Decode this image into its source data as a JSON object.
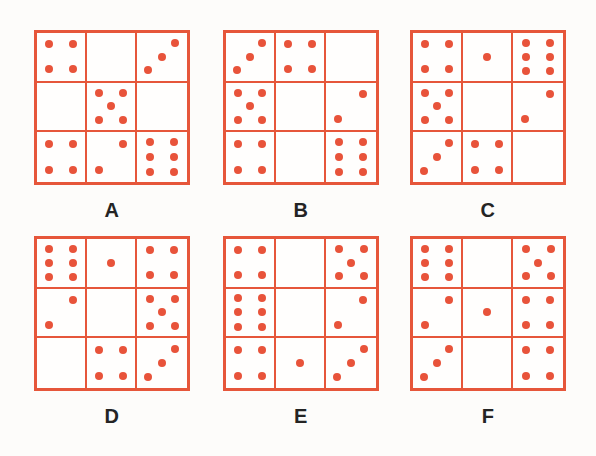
{
  "figure": {
    "accent_color": "#e8533a",
    "grid_line_color": "#e6563a",
    "label_color": "#242424",
    "background_color": "#fdfcfa",
    "panel_count": 6,
    "grid_rows": 3,
    "grid_cols": 3
  },
  "dot_layouts": {
    "0": [],
    "1": [
      [
        50,
        50
      ]
    ],
    "2": [
      [
        74,
        24
      ],
      [
        24,
        76
      ]
    ],
    "3": [
      [
        76,
        22
      ],
      [
        50,
        50
      ],
      [
        22,
        78
      ]
    ],
    "4": [
      [
        26,
        24
      ],
      [
        74,
        24
      ],
      [
        26,
        76
      ],
      [
        74,
        76
      ]
    ],
    "5": [
      [
        25,
        22
      ],
      [
        75,
        22
      ],
      [
        50,
        50
      ],
      [
        25,
        78
      ],
      [
        75,
        78
      ]
    ],
    "6": [
      [
        26,
        20
      ],
      [
        74,
        20
      ],
      [
        26,
        50
      ],
      [
        74,
        50
      ],
      [
        26,
        80
      ],
      [
        74,
        80
      ]
    ]
  },
  "panels": [
    {
      "id": "A",
      "label": "A",
      "cells": [
        {
          "row": 0,
          "col": 0,
          "count": 4,
          "pattern": "four-corners"
        },
        {
          "row": 0,
          "col": 1,
          "count": 0,
          "pattern": "empty"
        },
        {
          "row": 0,
          "col": 2,
          "count": 3,
          "pattern": "diagonal"
        },
        {
          "row": 1,
          "col": 0,
          "count": 0,
          "pattern": "empty"
        },
        {
          "row": 1,
          "col": 1,
          "count": 5,
          "pattern": "quincunx"
        },
        {
          "row": 1,
          "col": 2,
          "count": 0,
          "pattern": "empty"
        },
        {
          "row": 2,
          "col": 0,
          "count": 4,
          "pattern": "four-corners"
        },
        {
          "row": 2,
          "col": 1,
          "count": 2,
          "pattern": "two-opposite"
        },
        {
          "row": 2,
          "col": 2,
          "count": 6,
          "pattern": "six-two-columns"
        }
      ]
    },
    {
      "id": "B",
      "label": "B",
      "cells": [
        {
          "row": 0,
          "col": 0,
          "count": 3,
          "pattern": "diagonal"
        },
        {
          "row": 0,
          "col": 1,
          "count": 4,
          "pattern": "four-corners"
        },
        {
          "row": 0,
          "col": 2,
          "count": 0,
          "pattern": "empty"
        },
        {
          "row": 1,
          "col": 0,
          "count": 5,
          "pattern": "quincunx"
        },
        {
          "row": 1,
          "col": 1,
          "count": 0,
          "pattern": "empty"
        },
        {
          "row": 1,
          "col": 2,
          "count": 2,
          "pattern": "two-opposite"
        },
        {
          "row": 2,
          "col": 0,
          "count": 4,
          "pattern": "four-corners"
        },
        {
          "row": 2,
          "col": 1,
          "count": 0,
          "pattern": "empty"
        },
        {
          "row": 2,
          "col": 2,
          "count": 6,
          "pattern": "six-two-columns"
        }
      ]
    },
    {
      "id": "C",
      "label": "C",
      "cells": [
        {
          "row": 0,
          "col": 0,
          "count": 4,
          "pattern": "four-corners"
        },
        {
          "row": 0,
          "col": 1,
          "count": 1,
          "pattern": "center"
        },
        {
          "row": 0,
          "col": 2,
          "count": 6,
          "pattern": "six-two-columns"
        },
        {
          "row": 1,
          "col": 0,
          "count": 5,
          "pattern": "quincunx"
        },
        {
          "row": 1,
          "col": 1,
          "count": 0,
          "pattern": "empty"
        },
        {
          "row": 1,
          "col": 2,
          "count": 2,
          "pattern": "two-opposite"
        },
        {
          "row": 2,
          "col": 0,
          "count": 3,
          "pattern": "diagonal"
        },
        {
          "row": 2,
          "col": 1,
          "count": 4,
          "pattern": "four-corners"
        },
        {
          "row": 2,
          "col": 2,
          "count": 0,
          "pattern": "empty"
        }
      ]
    },
    {
      "id": "D",
      "label": "D",
      "cells": [
        {
          "row": 0,
          "col": 0,
          "count": 6,
          "pattern": "six-two-columns"
        },
        {
          "row": 0,
          "col": 1,
          "count": 1,
          "pattern": "center"
        },
        {
          "row": 0,
          "col": 2,
          "count": 4,
          "pattern": "four-corners"
        },
        {
          "row": 1,
          "col": 0,
          "count": 2,
          "pattern": "two-opposite"
        },
        {
          "row": 1,
          "col": 1,
          "count": 0,
          "pattern": "empty"
        },
        {
          "row": 1,
          "col": 2,
          "count": 5,
          "pattern": "quincunx"
        },
        {
          "row": 2,
          "col": 0,
          "count": 0,
          "pattern": "empty"
        },
        {
          "row": 2,
          "col": 1,
          "count": 4,
          "pattern": "four-corners"
        },
        {
          "row": 2,
          "col": 2,
          "count": 3,
          "pattern": "diagonal"
        }
      ]
    },
    {
      "id": "E",
      "label": "E",
      "cells": [
        {
          "row": 0,
          "col": 0,
          "count": 4,
          "pattern": "four-corners"
        },
        {
          "row": 0,
          "col": 1,
          "count": 0,
          "pattern": "empty"
        },
        {
          "row": 0,
          "col": 2,
          "count": 5,
          "pattern": "quincunx"
        },
        {
          "row": 1,
          "col": 0,
          "count": 6,
          "pattern": "six-two-columns"
        },
        {
          "row": 1,
          "col": 1,
          "count": 0,
          "pattern": "empty"
        },
        {
          "row": 1,
          "col": 2,
          "count": 2,
          "pattern": "two-opposite"
        },
        {
          "row": 2,
          "col": 0,
          "count": 4,
          "pattern": "four-corners"
        },
        {
          "row": 2,
          "col": 1,
          "count": 1,
          "pattern": "center"
        },
        {
          "row": 2,
          "col": 2,
          "count": 3,
          "pattern": "diagonal"
        }
      ]
    },
    {
      "id": "F",
      "label": "F",
      "cells": [
        {
          "row": 0,
          "col": 0,
          "count": 6,
          "pattern": "six-two-columns"
        },
        {
          "row": 0,
          "col": 1,
          "count": 0,
          "pattern": "empty"
        },
        {
          "row": 0,
          "col": 2,
          "count": 5,
          "pattern": "quincunx"
        },
        {
          "row": 1,
          "col": 0,
          "count": 2,
          "pattern": "two-opposite"
        },
        {
          "row": 1,
          "col": 1,
          "count": 1,
          "pattern": "center"
        },
        {
          "row": 1,
          "col": 2,
          "count": 4,
          "pattern": "four-corners"
        },
        {
          "row": 2,
          "col": 0,
          "count": 3,
          "pattern": "diagonal"
        },
        {
          "row": 2,
          "col": 1,
          "count": 0,
          "pattern": "empty"
        },
        {
          "row": 2,
          "col": 2,
          "count": 4,
          "pattern": "four-corners"
        }
      ]
    }
  ]
}
